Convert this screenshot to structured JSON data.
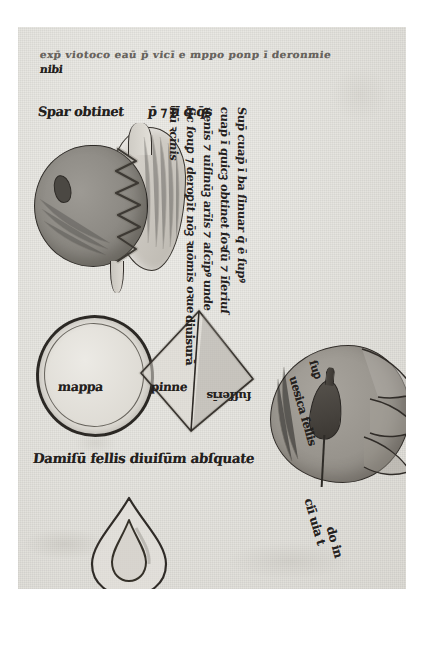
{
  "document": {
    "kind": "medieval-manuscript-folio",
    "script": "gothic-textualis",
    "language": "latin"
  },
  "header": {
    "line_1": "exp̄ viotoco eaū p̄ vicī e mppo ponp ī  deronmie",
    "line_2": "nibi"
  },
  "stomach": {
    "caption_left": "Spar obtinet",
    "caption_right": "p̄ ⁊ īī q̄ q̄s",
    "label_fundus": ""
  },
  "right_column": {
    "line_1": "Sup̄ cuap̄ ī ba ſinuar q̄ ē ſupꝰ",
    "line_2": "cuap̄ ī quicꝫ obtinet ſoꝛſū ⁊ īſeriuſ",
    "line_3": "uenīs ⁊ uīſinūꝫ arīis ⁊ aſcīpꝰ unde",
    "line_4": "ſic ſouꝑ ⁊ deroꝑīt nōꝫ ꝛuōmīs oꝛue",
    "line_5": "hū ꝛcīnis"
  },
  "oval_figure": {
    "label": "mappa"
  },
  "triangle_figure": {
    "label_left": "pinne",
    "label_vertical": "diuisurā",
    "label_right": "ſuſſerīs"
  },
  "liver_figure": {
    "label_1": "uesica fellis",
    "label_2": "ſuꝑ",
    "label_3": "ciī uia t",
    "label_4": "do in"
  },
  "gall_caption": {
    "text": "Damiſū fellis diuiſūm abſquate"
  },
  "drop_figure": {
    "label": ""
  },
  "colors": {
    "parchment": "#e7e6e1",
    "ink": "#23201d",
    "wash_dark": "#8b8882",
    "wash_light": "#ddd9d2",
    "page_background": "#ffffff"
  }
}
